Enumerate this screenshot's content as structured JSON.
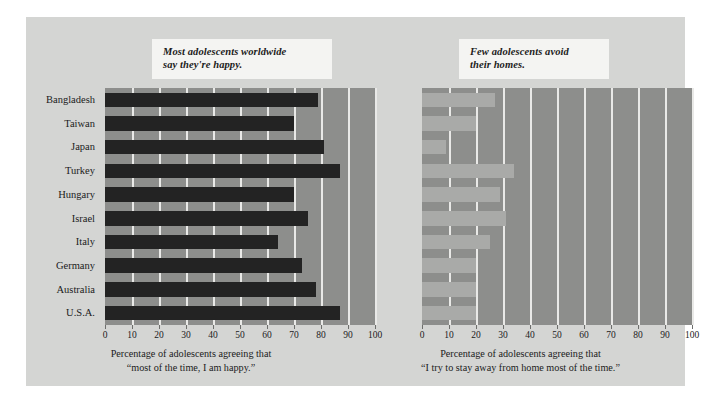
{
  "chart_data": [
    {
      "type": "bar",
      "orientation": "horizontal",
      "title": "Most adolescents worldwide\nsay they're happy.",
      "xlabel": "Percentage of adolescents agreeing that\n“most of the time, I am happy.”",
      "ylabel": "",
      "xlim": [
        0,
        100
      ],
      "xticks": [
        0,
        10,
        20,
        30,
        40,
        50,
        60,
        70,
        80,
        90,
        100
      ],
      "grid": true,
      "grid_axis": "x",
      "legend": "none",
      "bar_color": "#232323",
      "plot_background": "#8d8e8c",
      "categories": [
        "Bangladesh",
        "Taiwan",
        "Japan",
        "Turkey",
        "Hungary",
        "Israel",
        "Italy",
        "Germany",
        "Australia",
        "U.S.A."
      ],
      "values": [
        79,
        70,
        81,
        87,
        70,
        75,
        64,
        73,
        78,
        87
      ]
    },
    {
      "type": "bar",
      "orientation": "horizontal",
      "title": "Few adolescents avoid\ntheir homes.",
      "xlabel": "Percentage of adolescents agreeing that\n“I try to stay away from home most of the time.”",
      "ylabel": "",
      "xlim": [
        0,
        100
      ],
      "xticks": [
        0,
        10,
        20,
        30,
        40,
        50,
        60,
        70,
        80,
        90,
        100
      ],
      "grid": true,
      "grid_axis": "x",
      "legend": "none",
      "bar_color": "#a9aaa8",
      "plot_background": "#8d8e8c",
      "categories": [
        "Bangladesh",
        "Taiwan",
        "Japan",
        "Turkey",
        "Hungary",
        "Israel",
        "Italy",
        "Germany",
        "Australia",
        "U.S.A."
      ],
      "values": [
        27,
        20,
        9,
        34,
        29,
        31,
        25,
        20,
        20,
        20
      ]
    }
  ],
  "figure": {
    "panel_background": "#d4d5d3",
    "page_background": "#ffffff",
    "callout_background": "#f4f4f2",
    "gridline_color": "#e9e9e7"
  }
}
